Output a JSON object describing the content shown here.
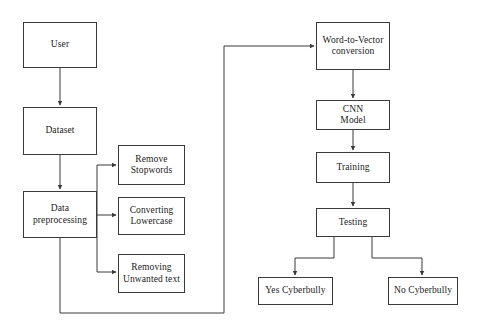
{
  "diagram": {
    "stroke_color": "#3a3a3a",
    "text_color": "#1b1b1b",
    "background_color": "#ffffff",
    "nodes": {
      "user": "User",
      "dataset": "Dataset",
      "preprocessing": "Data\npreprocessing",
      "remove_stopwords": "Remove\nStopwords",
      "converting_lowercase": "Converting\nLowercase",
      "removing_unwanted_text": "Removing\nUnwanted text",
      "word_to_vector": "Word-to-Vector\nconversion",
      "cnn_model": "CNN\nModel",
      "training": "Training",
      "testing": "Testing",
      "yes_cyberbully": "Yes Cyberbully",
      "no_cyberbully": "No Cyberbully"
    },
    "edges": [
      {
        "from": "user",
        "to": "dataset",
        "label": ""
      },
      {
        "from": "dataset",
        "to": "preprocessing",
        "label": ""
      },
      {
        "from": "preprocessing",
        "to": "remove_stopwords",
        "label": ""
      },
      {
        "from": "preprocessing",
        "to": "converting_lowercase",
        "label": ""
      },
      {
        "from": "preprocessing",
        "to": "removing_unwanted_text",
        "label": ""
      },
      {
        "from": "preprocessing",
        "to": "word_to_vector",
        "label": ""
      },
      {
        "from": "word_to_vector",
        "to": "cnn_model",
        "label": ""
      },
      {
        "from": "cnn_model",
        "to": "training",
        "label": ""
      },
      {
        "from": "training",
        "to": "testing",
        "label": ""
      },
      {
        "from": "testing",
        "to": "yes_cyberbully",
        "label": ""
      },
      {
        "from": "testing",
        "to": "no_cyberbully",
        "label": ""
      }
    ]
  }
}
